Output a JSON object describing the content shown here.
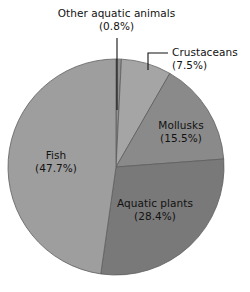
{
  "chart_data": {
    "type": "pie",
    "title": "",
    "subtitle": "",
    "xlabel": "",
    "ylabel": "",
    "legend_position": "none",
    "grid": false,
    "units": "percent",
    "start_angle_deg": 0,
    "direction": "clockwise",
    "categories": [
      "Other aquatic animals",
      "Crustaceans",
      "Mollusks",
      "Aquatic plants",
      "Fish"
    ],
    "values": [
      0.8,
      7.5,
      15.5,
      28.4,
      47.7
    ],
    "slices": [
      {
        "name": "other-aquatic-animals",
        "label": "Other aquatic animals",
        "value": 0.8,
        "value_text": "(0.8%)",
        "color": "#8f8f8f",
        "label_placement": "outside-top",
        "leader": "vertical"
      },
      {
        "name": "crustaceans",
        "label": "Crustaceans",
        "value": 7.5,
        "value_text": "(7.5%)",
        "color": "#a5a5a5",
        "label_placement": "outside-right",
        "leader": "elbow"
      },
      {
        "name": "mollusks",
        "label": "Mollusks",
        "value": 15.5,
        "value_text": "(15.5%)",
        "color": "#8a8a8a",
        "label_placement": "inside",
        "leader": "none"
      },
      {
        "name": "aquatic-plants",
        "label": "Aquatic plants",
        "value": 28.4,
        "value_text": "(28.4%)",
        "color": "#797979",
        "label_placement": "inside",
        "leader": "none"
      },
      {
        "name": "fish",
        "label": "Fish",
        "value": 47.7,
        "value_text": "(47.7%)",
        "color": "#9e9e9e",
        "label_placement": "inside",
        "leader": "none"
      }
    ]
  },
  "labels": {
    "other": {
      "line1": "Other aquatic animals",
      "line2": "(0.8%)"
    },
    "crustaceans": {
      "line1": "Crustaceans",
      "line2": "(7.5%)"
    },
    "mollusks": {
      "line1": "Mollusks",
      "line2": "(15.5%)"
    },
    "aquatic_plants": {
      "line1": "Aquatic plants",
      "line2": "(28.4%)"
    },
    "fish": {
      "line1": "Fish",
      "line2": "(47.7%)"
    }
  },
  "geometry": {
    "center_x": 116,
    "center_y": 167,
    "radius": 108
  },
  "colors": {
    "background": "#ffffff",
    "outline": "#5e5e5e",
    "leader_line": "#111111",
    "text": "#121212"
  }
}
